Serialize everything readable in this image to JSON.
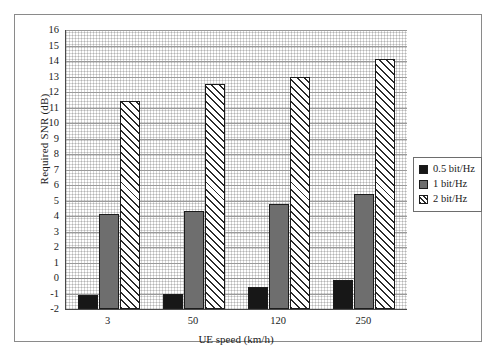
{
  "chart_data": {
    "type": "bar",
    "title": "",
    "xlabel": "UE speed (km/h)",
    "ylabel": "Required SNR (dB)",
    "categories": [
      "3",
      "50",
      "120",
      "250"
    ],
    "ylim": [
      -2,
      16
    ],
    "ytick_step": 1,
    "yticks": [
      16,
      15,
      14,
      13,
      12,
      11,
      10,
      9,
      8,
      7,
      6,
      5,
      4,
      3,
      2,
      1,
      0,
      -1,
      -2
    ],
    "ytick_labels": [
      "16",
      "15",
      "14",
      "13",
      "12",
      "11",
      "10",
      "9",
      "8",
      "7",
      "6",
      "5",
      "4",
      "3",
      "2",
      "1",
      "0",
      "-1",
      "-2"
    ],
    "grid": true,
    "legend_position": "right",
    "series": [
      {
        "name": "0.5 bit/Hz",
        "color": "#171717",
        "pattern": "solid",
        "values": [
          -1.1,
          -1.0,
          -0.6,
          -0.15
        ]
      },
      {
        "name": "1 bit/Hz",
        "color": "#6e6e6e",
        "pattern": "solid",
        "values": [
          4.1,
          4.35,
          4.75,
          5.4
        ]
      },
      {
        "name": "2 bit/Hz",
        "color": "#ffffff",
        "pattern": "hatch",
        "values": [
          11.4,
          12.5,
          13.0,
          14.1
        ]
      }
    ]
  },
  "legend": {
    "entries": [
      {
        "label": "0.5 bit/Hz"
      },
      {
        "label": "1 bit/Hz"
      },
      {
        "label": "2 bit/Hz"
      }
    ]
  }
}
